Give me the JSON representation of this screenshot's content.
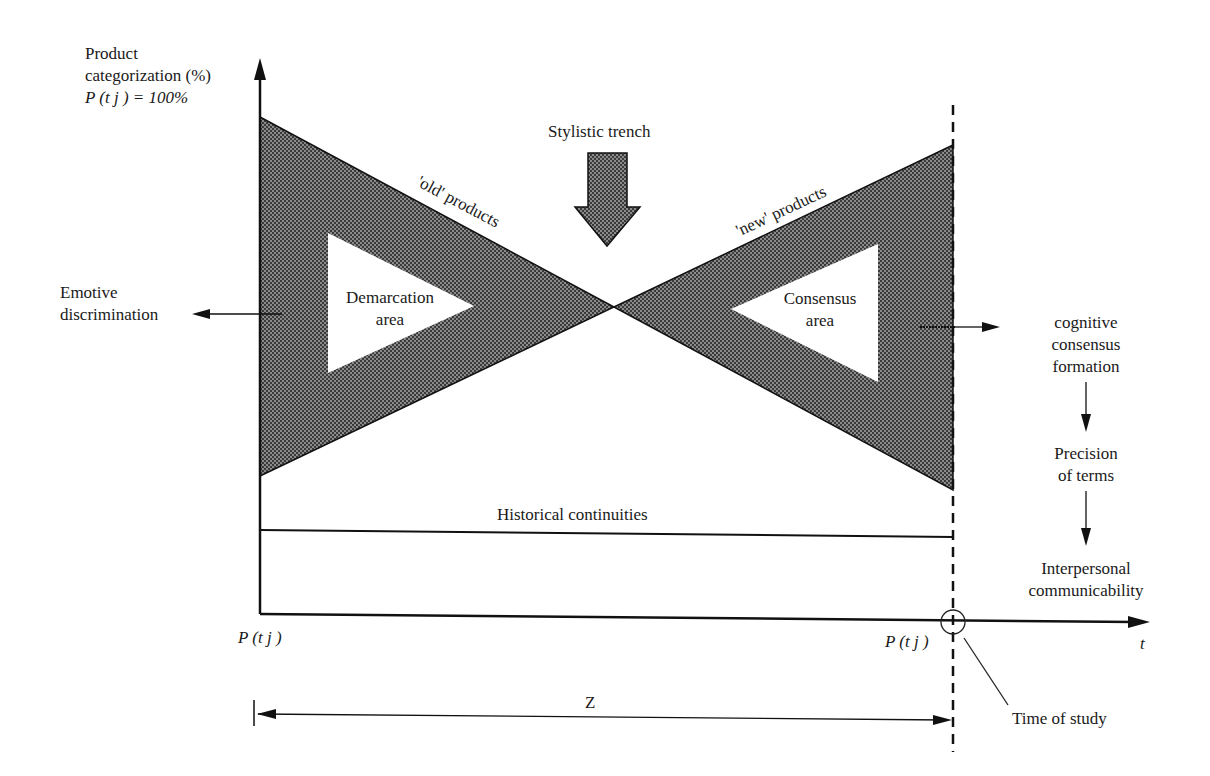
{
  "y_axis": {
    "label_line1": "Product",
    "label_line2": "categorization (%)",
    "label_line3": "P (t j ) = 100%"
  },
  "x_axis": {
    "label": "t",
    "start_label": "P (t j )",
    "end_label": "P (t j )"
  },
  "labels": {
    "stylistic_trench": "Stylistic trench",
    "old_products": "'old' products",
    "new_products": "'new' products",
    "demarcation_line1": "Demarcation",
    "demarcation_line2": "area",
    "consensus_line1": "Consensus",
    "consensus_line2": "area",
    "emotive_line1": "Emotive",
    "emotive_line2": "discrimination",
    "historical": "Historical continuities",
    "z": "Z",
    "time_of_study": "Time of study"
  },
  "flow": {
    "step1_line1": "cognitive",
    "step1_line2": "consensus",
    "step1_line3": "formation",
    "step2_line1": "Precision",
    "step2_line2": "of terms",
    "step3_line1": "Interpersonal",
    "step3_line2": "communicability"
  },
  "colors": {
    "hatch": "#555555",
    "line": "#111111"
  }
}
